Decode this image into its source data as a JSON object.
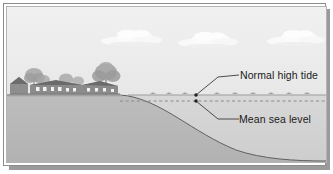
{
  "figure": {
    "kind": "coastal-cross-section-diagram",
    "title": "",
    "frame": {
      "border_color": "#8c8c8c",
      "inner_border_color": "#b4b4b4",
      "shadow_color": "#9a9a9a",
      "background_color": "#ffffff"
    },
    "sky": {
      "name": "sky",
      "top_color": "#efefef",
      "bottom_color": "#e2e2e2"
    },
    "clouds": [
      {
        "name": "cloud-left",
        "cx": 131,
        "cy": 39,
        "w": 56,
        "h": 15
      },
      {
        "name": "cloud-center",
        "cx": 208,
        "cy": 41,
        "w": 56,
        "h": 15
      },
      {
        "name": "cloud-right",
        "cx": 295,
        "cy": 39,
        "w": 52,
        "h": 14
      }
    ],
    "land": {
      "name": "land-mass",
      "fill_color": "#b9b9b9",
      "outline_color": "#5a5a5a",
      "plateau_top_y": 95,
      "underwater_toe_y": 160
    },
    "water": {
      "name": "water-body",
      "fill_color": "#d2d2d2"
    },
    "village": {
      "name": "coastal-village",
      "building_color": "#8f8f8f",
      "roof_color": "#6e6e6e",
      "tree_color": "#9c9c9c",
      "window_color": "#f2f2f2"
    },
    "levels": [
      {
        "id": "normal-high-tide",
        "label": "Normal high tide",
        "line_style": "solid",
        "line_color": "#9b9b9b",
        "y": 95,
        "marker": {
          "x": 196,
          "y": 95
        },
        "leader": {
          "elbow_x": 218,
          "elbow_y": 77,
          "end_x": 238,
          "end_y": 75
        }
      },
      {
        "id": "mean-sea-level",
        "label": "Mean sea level",
        "line_style": "dashed",
        "line_color": "#8a8a8a",
        "y": 101,
        "marker": {
          "x": 196,
          "y": 101
        },
        "leader": {
          "elbow_x": 218,
          "elbow_y": 119,
          "end_x": 238,
          "end_y": 119
        }
      }
    ]
  }
}
